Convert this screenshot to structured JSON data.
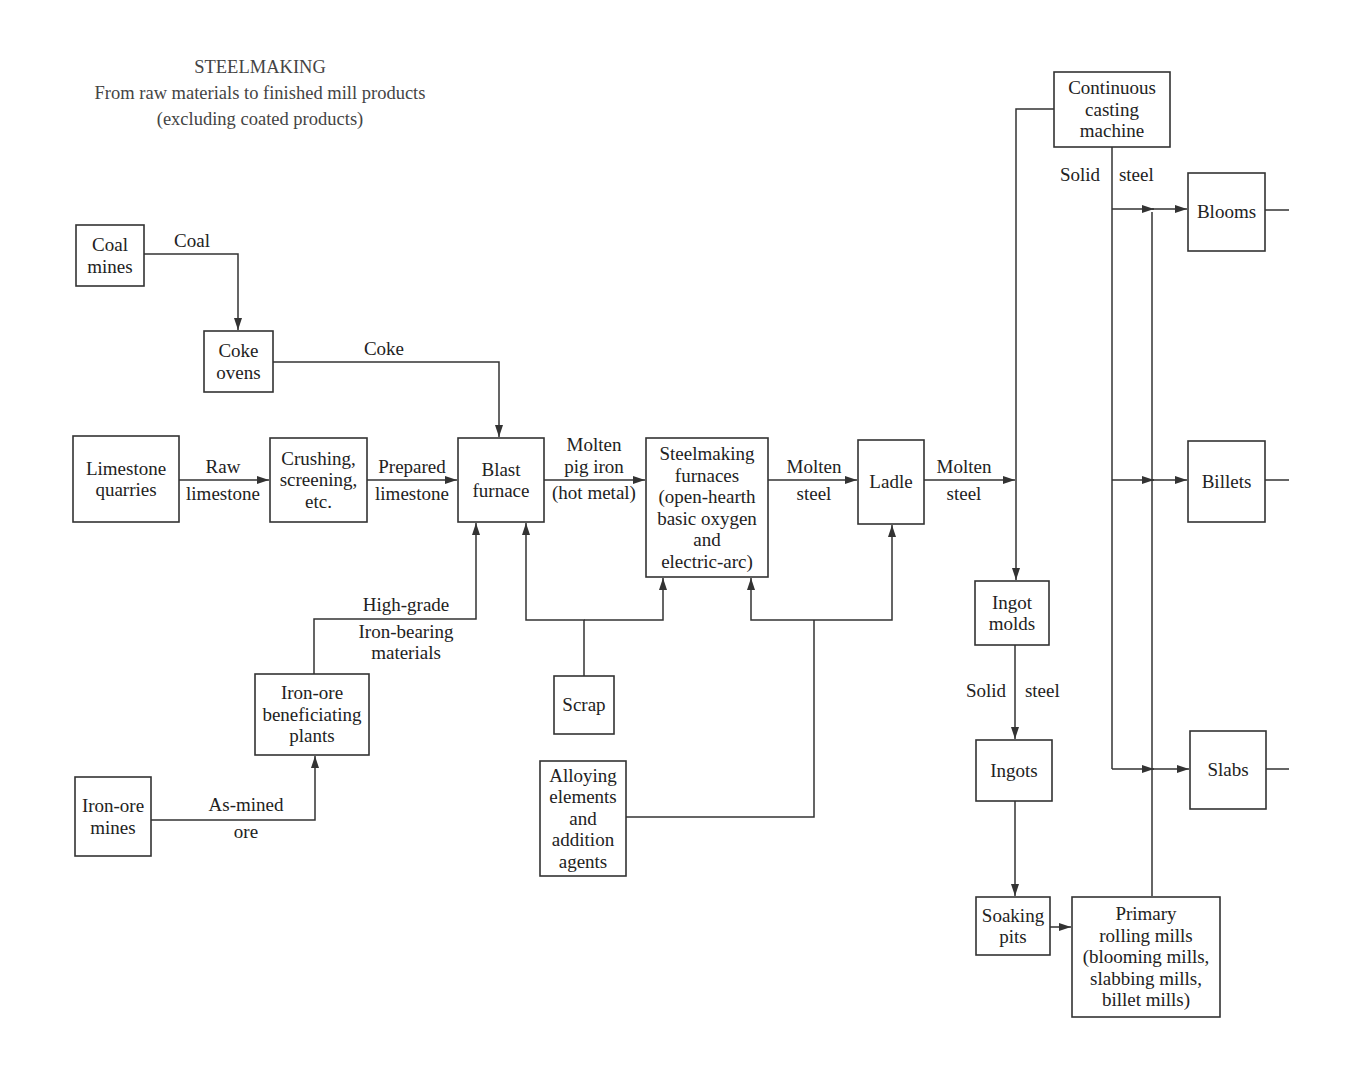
{
  "title": {
    "line1": "STEELMAKING",
    "line2": "From raw materials to finished mill products",
    "line3": "(excluding coated products)"
  },
  "nodes": {
    "coal_mines": [
      "Coal",
      "mines"
    ],
    "coke_ovens": [
      "Coke",
      "ovens"
    ],
    "limestone_quarries": [
      "Limestone",
      "quarries"
    ],
    "crushing": [
      "Crushing,",
      "screening,",
      "etc."
    ],
    "blast_furnace": [
      "Blast",
      "furnace"
    ],
    "steelmaking_furnaces": [
      "Steelmaking",
      "furnaces",
      "(open-hearth",
      "basic oxygen",
      "and",
      "electric-arc)"
    ],
    "ladle": [
      "Ladle"
    ],
    "continuous_casting": [
      "Continuous",
      "casting",
      "machine"
    ],
    "blooms": [
      "Blooms"
    ],
    "billets": [
      "Billets"
    ],
    "slabs": [
      "Slabs"
    ],
    "ingot_molds": [
      "Ingot",
      "molds"
    ],
    "ingots": [
      "Ingots"
    ],
    "soaking_pits": [
      "Soaking",
      "pits"
    ],
    "primary_rolling_mills": [
      "Primary",
      "rolling mills",
      "(blooming mills,",
      "slabbing mills,",
      "billet mills)"
    ],
    "iron_ore_beneficiating": [
      "Iron-ore",
      "beneficiating",
      "plants"
    ],
    "iron_ore_mines": [
      "Iron-ore",
      "mines"
    ],
    "scrap": [
      "Scrap"
    ],
    "alloying": [
      "Alloying",
      "elements",
      "and",
      "addition",
      "agents"
    ]
  },
  "edge_labels": {
    "coal": "Coal",
    "coke": "Coke",
    "raw_limestone": [
      "Raw",
      "limestone"
    ],
    "prepared_limestone": [
      "Prepared",
      "limestone"
    ],
    "molten_pig_iron": [
      "Molten",
      "pig iron",
      "(hot metal)"
    ],
    "molten_steel_1": [
      "Molten",
      "steel"
    ],
    "molten_steel_2": [
      "Molten",
      "steel"
    ],
    "solid_steel_cc": [
      "Solid",
      "steel"
    ],
    "solid_steel_ingot": [
      "Solid",
      "steel"
    ],
    "high_grade": [
      "High-grade",
      "Iron-bearing",
      "materials"
    ],
    "as_mined_ore": [
      "As-mined",
      "ore"
    ]
  }
}
